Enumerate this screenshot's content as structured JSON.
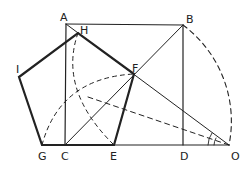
{
  "diagram": {
    "type": "geometric construction",
    "points": {
      "A": [
        66,
        24
      ],
      "B": [
        183,
        25
      ],
      "H": [
        78,
        33
      ],
      "F": [
        134,
        74
      ],
      "I": [
        19,
        77
      ],
      "G": [
        42,
        145
      ],
      "C": [
        65,
        145
      ],
      "E": [
        114,
        145
      ],
      "D": [
        183,
        145
      ],
      "O": [
        229,
        145
      ]
    },
    "labels": [
      {
        "id": "A",
        "text": "A",
        "x": 60,
        "y": 12
      },
      {
        "id": "H",
        "text": "H",
        "x": 80,
        "y": 25
      },
      {
        "id": "B",
        "text": "B",
        "x": 186,
        "y": 14
      },
      {
        "id": "F",
        "text": "F",
        "x": 132,
        "y": 63
      },
      {
        "id": "I",
        "text": "I",
        "x": 16,
        "y": 64
      },
      {
        "id": "G",
        "text": "G",
        "x": 38,
        "y": 151
      },
      {
        "id": "C",
        "text": "C",
        "x": 61,
        "y": 151
      },
      {
        "id": "E",
        "text": "E",
        "x": 110,
        "y": 151
      },
      {
        "id": "D",
        "text": "D",
        "x": 180,
        "y": 151
      },
      {
        "id": "O",
        "text": "O",
        "x": 231,
        "y": 151
      }
    ]
  }
}
